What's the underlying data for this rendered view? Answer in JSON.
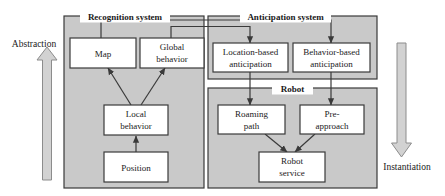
{
  "figure": {
    "type": "block-diagram",
    "background": "#ffffff",
    "panel_fill": "#c9c9c9",
    "box_fill": "#ffffff",
    "stroke": "#3a3a3a",
    "big_arrow_fill": "#d2d2d2"
  },
  "panels": {
    "recognition": {
      "title": "Recognition system"
    },
    "anticipation": {
      "title": "Anticipation system"
    },
    "robot": {
      "title": "Robot"
    }
  },
  "boxes": {
    "map": {
      "label": "Map"
    },
    "global_behavior": {
      "line1": "Global",
      "line2": "behavior"
    },
    "local_behavior": {
      "line1": "Local",
      "line2": "behavior"
    },
    "position": {
      "label": "Position"
    },
    "location_based": {
      "line1": "Location-based",
      "line2": "anticipation"
    },
    "behavior_based": {
      "line1": "Behavior-based",
      "line2": "anticipation"
    },
    "roaming_path": {
      "line1": "Roaming",
      "line2": "path"
    },
    "pre_approach": {
      "line1": "Pre-",
      "line2": "approach"
    },
    "robot_service": {
      "line1": "Robot",
      "line2": "service"
    }
  },
  "axes": {
    "abstraction": {
      "label": "Abstraction",
      "direction": "up"
    },
    "instantiation": {
      "label": "Instantiation",
      "direction": "down"
    }
  }
}
